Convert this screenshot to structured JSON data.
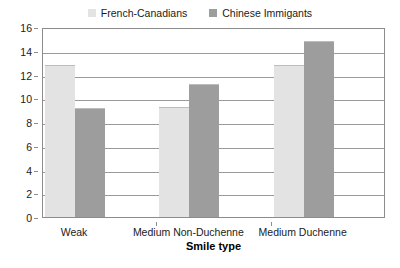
{
  "chart_data": {
    "type": "bar",
    "title": "",
    "xlabel": "Smile type",
    "ylabel": "",
    "categories": [
      "Weak",
      "Medium Non-Duchenne",
      "Medium Duchenne"
    ],
    "series": [
      {
        "name": "French-Canadians",
        "color": "#e3e3e3",
        "values": [
          12.8,
          9.3,
          12.8
        ]
      },
      {
        "name": "Chinese Immigants",
        "color": "#9d9d9d",
        "values": [
          9.2,
          11.2,
          14.8
        ]
      }
    ],
    "ylim": [
      0,
      16
    ],
    "yticks": [
      0,
      2,
      4,
      6,
      8,
      10,
      12,
      14,
      16
    ],
    "ytick_labels": [
      "0",
      "2",
      "4",
      "6",
      "8",
      "10",
      "12",
      "14",
      "16"
    ],
    "grid": true,
    "legend_position": "top-center",
    "frame_color": "#8c8c8c",
    "gridline_color": "#9a9a9a",
    "bar_edge_color": "#bdbdbd"
  }
}
